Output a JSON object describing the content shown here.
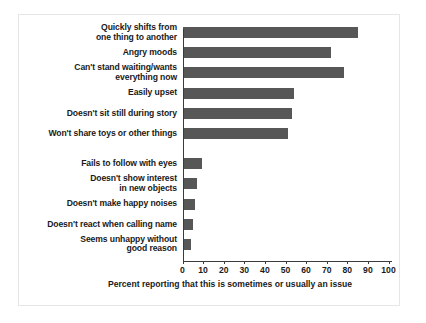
{
  "chart_data": {
    "type": "bar",
    "orientation": "horizontal",
    "title": "",
    "xlabel": "Percent reporting that this is sometimes or usually an issue",
    "ylabel": "",
    "xlim": [
      0,
      100
    ],
    "xticks": [
      0,
      10,
      20,
      30,
      40,
      50,
      60,
      70,
      80,
      90,
      100
    ],
    "grid": false,
    "legend": null,
    "bar_color": "#575757",
    "categories": [
      "Quickly shifts from one thing to another",
      "Angry moods",
      "Can't stand waiting/wants everything now",
      "Easily upset",
      "Doesn't sit still during story",
      "Won't share toys or other things",
      "Fails to follow with eyes",
      "Doesn't show interest in new objects",
      "Doesn't make happy noises",
      "Doesn't react when calling name",
      "Seems unhappy without good reason"
    ],
    "values": [
      85,
      72,
      78,
      54,
      53,
      51,
      9,
      7,
      6,
      5,
      4
    ]
  },
  "labels": [
    {
      "lines": [
        "Quickly shifts from",
        "one thing to another"
      ]
    },
    {
      "lines": [
        "Angry moods"
      ]
    },
    {
      "lines": [
        "Can't stand waiting/wants",
        "everything now"
      ]
    },
    {
      "lines": [
        "Easily upset"
      ]
    },
    {
      "lines": [
        "Doesn't sit still during story"
      ]
    },
    {
      "lines": [
        "Won't share toys or other things"
      ]
    },
    {
      "lines": [
        "Fails to follow with eyes"
      ]
    },
    {
      "lines": [
        "Doesn't show interest",
        "in new objects"
      ]
    },
    {
      "lines": [
        "Doesn't make happy noises"
      ]
    },
    {
      "lines": [
        "Doesn't react when calling name"
      ]
    },
    {
      "lines": [
        "Seems unhappy without",
        "good reason"
      ]
    }
  ],
  "axis": {
    "ticks": [
      "0",
      "10",
      "20",
      "30",
      "40",
      "50",
      "60",
      "70",
      "80",
      "90",
      "100"
    ],
    "caption": "Percent reporting that this is sometimes or usually an issue"
  }
}
